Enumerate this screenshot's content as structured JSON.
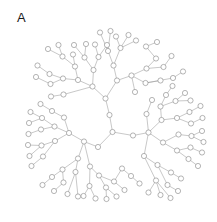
{
  "panel": {
    "label": "A",
    "width": 217,
    "height": 222,
    "background": "#ffffff"
  },
  "chart_data": {
    "type": "diagram",
    "subtype": "radial-tree-graph",
    "title": "A",
    "xlabel": "",
    "ylabel": "",
    "grid": false,
    "legend": null,
    "style": {
      "node_fill": "#ffffff",
      "node_stroke": "#8c8c8c",
      "node_radius": 2.6,
      "edge_color": "#9a9a9a",
      "edge_width": 0.55
    },
    "root": "n0",
    "node_count": 121,
    "edge_count": 120,
    "nodes": [
      {
        "id": "n0",
        "x": 112.5,
        "y": 132.0,
        "depth": 0
      },
      {
        "id": "n1",
        "x": 109.5,
        "y": 115.0,
        "depth": 1
      },
      {
        "id": "n2",
        "x": 133.0,
        "y": 135.5,
        "depth": 1
      },
      {
        "id": "n3",
        "x": 98.0,
        "y": 147.0,
        "depth": 1
      },
      {
        "id": "n4",
        "x": 105.5,
        "y": 98.5,
        "depth": 2
      },
      {
        "id": "n5",
        "x": 92.5,
        "y": 86.5,
        "depth": 3
      },
      {
        "id": "n6",
        "x": 117.0,
        "y": 80.5,
        "depth": 3
      },
      {
        "id": "n7",
        "x": 78.0,
        "y": 80.0,
        "depth": 4
      },
      {
        "id": "n8",
        "x": 93.5,
        "y": 70.0,
        "depth": 4
      },
      {
        "id": "n9",
        "x": 63.0,
        "y": 78.5,
        "depth": 5
      },
      {
        "id": "n10",
        "x": 75.0,
        "y": 66.5,
        "depth": 5
      },
      {
        "id": "n11",
        "x": 49.5,
        "y": 74.0,
        "depth": 6
      },
      {
        "id": "n12",
        "x": 50.5,
        "y": 84.0,
        "depth": 6
      },
      {
        "id": "n13",
        "x": 37.5,
        "y": 65.5,
        "depth": 6
      },
      {
        "id": "n14",
        "x": 36.0,
        "y": 77.0,
        "depth": 6
      },
      {
        "id": "n15",
        "x": 62.5,
        "y": 56.5,
        "depth": 6
      },
      {
        "id": "n16",
        "x": 73.0,
        "y": 54.5,
        "depth": 6
      },
      {
        "id": "n17",
        "x": 48.0,
        "y": 49.0,
        "depth": 7
      },
      {
        "id": "n18",
        "x": 58.5,
        "y": 45.0,
        "depth": 7
      },
      {
        "id": "n19",
        "x": 84.5,
        "y": 57.5,
        "depth": 5
      },
      {
        "id": "n20",
        "x": 98.5,
        "y": 57.0,
        "depth": 5
      },
      {
        "id": "n21",
        "x": 74.0,
        "y": 45.0,
        "depth": 6
      },
      {
        "id": "n22",
        "x": 86.0,
        "y": 44.0,
        "depth": 6
      },
      {
        "id": "n23",
        "x": 95.0,
        "y": 44.5,
        "depth": 6
      },
      {
        "id": "n24",
        "x": 107.0,
        "y": 45.0,
        "depth": 6
      },
      {
        "id": "n25",
        "x": 113.5,
        "y": 65.5,
        "depth": 4
      },
      {
        "id": "n26",
        "x": 131.5,
        "y": 75.5,
        "depth": 4
      },
      {
        "id": "n27",
        "x": 108.0,
        "y": 51.0,
        "depth": 5
      },
      {
        "id": "n28",
        "x": 120.5,
        "y": 48.0,
        "depth": 5
      },
      {
        "id": "n29",
        "x": 116.0,
        "y": 36.5,
        "depth": 6
      },
      {
        "id": "n30",
        "x": 128.5,
        "y": 35.0,
        "depth": 6
      },
      {
        "id": "n31",
        "x": 136.0,
        "y": 40.5,
        "depth": 6
      },
      {
        "id": "n32",
        "x": 146.5,
        "y": 68.5,
        "depth": 5
      },
      {
        "id": "n33",
        "x": 145.5,
        "y": 83.0,
        "depth": 5
      },
      {
        "id": "n34",
        "x": 156.0,
        "y": 58.5,
        "depth": 6
      },
      {
        "id": "n35",
        "x": 163.5,
        "y": 67.0,
        "depth": 6
      },
      {
        "id": "n36",
        "x": 171.5,
        "y": 56.0,
        "depth": 7
      },
      {
        "id": "n37",
        "x": 160.5,
        "y": 80.5,
        "depth": 6
      },
      {
        "id": "n38",
        "x": 173.0,
        "y": 78.0,
        "depth": 6
      },
      {
        "id": "n39",
        "x": 183.0,
        "y": 71.5,
        "depth": 7
      },
      {
        "id": "n40",
        "x": 148.5,
        "y": 132.5,
        "depth": 2
      },
      {
        "id": "n41",
        "x": 161.5,
        "y": 120.0,
        "depth": 3
      },
      {
        "id": "n42",
        "x": 163.0,
        "y": 142.5,
        "depth": 3
      },
      {
        "id": "n43",
        "x": 160.5,
        "y": 106.5,
        "depth": 4
      },
      {
        "id": "n44",
        "x": 177.0,
        "y": 118.0,
        "depth": 4
      },
      {
        "id": "n45",
        "x": 166.0,
        "y": 95.0,
        "depth": 5
      },
      {
        "id": "n46",
        "x": 175.5,
        "y": 101.0,
        "depth": 5
      },
      {
        "id": "n47",
        "x": 172.5,
        "y": 86.0,
        "depth": 6
      },
      {
        "id": "n48",
        "x": 185.0,
        "y": 93.0,
        "depth": 6
      },
      {
        "id": "n49",
        "x": 190.5,
        "y": 100.5,
        "depth": 6
      },
      {
        "id": "n50",
        "x": 189.5,
        "y": 112.0,
        "depth": 5
      },
      {
        "id": "n51",
        "x": 191.0,
        "y": 123.5,
        "depth": 5
      },
      {
        "id": "n52",
        "x": 200.5,
        "y": 106.0,
        "depth": 6
      },
      {
        "id": "n53",
        "x": 202.5,
        "y": 118.0,
        "depth": 6
      },
      {
        "id": "n54",
        "x": 178.5,
        "y": 134.5,
        "depth": 4
      },
      {
        "id": "n55",
        "x": 177.0,
        "y": 150.5,
        "depth": 4
      },
      {
        "id": "n56",
        "x": 191.5,
        "y": 136.0,
        "depth": 5
      },
      {
        "id": "n57",
        "x": 202.0,
        "y": 131.0,
        "depth": 6
      },
      {
        "id": "n58",
        "x": 203.5,
        "y": 142.0,
        "depth": 6
      },
      {
        "id": "n59",
        "x": 190.5,
        "y": 147.5,
        "depth": 5
      },
      {
        "id": "n60",
        "x": 202.0,
        "y": 152.5,
        "depth": 6
      },
      {
        "id": "n61",
        "x": 188.5,
        "y": 159.0,
        "depth": 5
      },
      {
        "id": "n62",
        "x": 198.0,
        "y": 166.0,
        "depth": 6
      },
      {
        "id": "n63",
        "x": 144.0,
        "y": 156.0,
        "depth": 3
      },
      {
        "id": "n64",
        "x": 157.5,
        "y": 165.0,
        "depth": 4
      },
      {
        "id": "n65",
        "x": 171.0,
        "y": 172.5,
        "depth": 5
      },
      {
        "id": "n66",
        "x": 181.0,
        "y": 178.5,
        "depth": 6
      },
      {
        "id": "n67",
        "x": 167.5,
        "y": 185.0,
        "depth": 5
      },
      {
        "id": "n68",
        "x": 178.0,
        "y": 191.0,
        "depth": 6
      },
      {
        "id": "n69",
        "x": 156.0,
        "y": 180.5,
        "depth": 4
      },
      {
        "id": "n70",
        "x": 148.5,
        "y": 192.5,
        "depth": 5
      },
      {
        "id": "n71",
        "x": 160.5,
        "y": 195.0,
        "depth": 5
      },
      {
        "id": "n72",
        "x": 170.5,
        "y": 198.0,
        "depth": 5
      },
      {
        "id": "n73",
        "x": 84.0,
        "y": 141.5,
        "depth": 2
      },
      {
        "id": "n74",
        "x": 69.0,
        "y": 133.0,
        "depth": 3
      },
      {
        "id": "n75",
        "x": 78.0,
        "y": 158.5,
        "depth": 3
      },
      {
        "id": "n76",
        "x": 54.5,
        "y": 126.5,
        "depth": 4
      },
      {
        "id": "n77",
        "x": 55.0,
        "y": 141.0,
        "depth": 4
      },
      {
        "id": "n78",
        "x": 42.0,
        "y": 118.0,
        "depth": 5
      },
      {
        "id": "n79",
        "x": 41.0,
        "y": 129.5,
        "depth": 5
      },
      {
        "id": "n80",
        "x": 30.5,
        "y": 112.0,
        "depth": 6
      },
      {
        "id": "n81",
        "x": 29.0,
        "y": 123.0,
        "depth": 6
      },
      {
        "id": "n82",
        "x": 28.5,
        "y": 134.0,
        "depth": 6
      },
      {
        "id": "n83",
        "x": 41.5,
        "y": 145.5,
        "depth": 5
      },
      {
        "id": "n84",
        "x": 28.0,
        "y": 145.0,
        "depth": 6
      },
      {
        "id": "n85",
        "x": 29.5,
        "y": 156.0,
        "depth": 6
      },
      {
        "id": "n86",
        "x": 43.0,
        "y": 156.5,
        "depth": 5
      },
      {
        "id": "n87",
        "x": 31.5,
        "y": 166.0,
        "depth": 6
      },
      {
        "id": "n88",
        "x": 62.5,
        "y": 169.5,
        "depth": 4
      },
      {
        "id": "n89",
        "x": 75.5,
        "y": 172.0,
        "depth": 4
      },
      {
        "id": "n90",
        "x": 52.0,
        "y": 177.0,
        "depth": 5
      },
      {
        "id": "n91",
        "x": 63.5,
        "y": 182.5,
        "depth": 5
      },
      {
        "id": "n92",
        "x": 42.5,
        "y": 185.0,
        "depth": 6
      },
      {
        "id": "n93",
        "x": 54.0,
        "y": 191.0,
        "depth": 6
      },
      {
        "id": "n94",
        "x": 67.5,
        "y": 194.0,
        "depth": 6
      },
      {
        "id": "n95",
        "x": 78.0,
        "y": 196.5,
        "depth": 6
      },
      {
        "id": "n96",
        "x": 90.0,
        "y": 166.5,
        "depth": 4
      },
      {
        "id": "n97",
        "x": 99.0,
        "y": 175.5,
        "depth": 5
      },
      {
        "id": "n98",
        "x": 89.5,
        "y": 186.0,
        "depth": 5
      },
      {
        "id": "n99",
        "x": 83.5,
        "y": 196.0,
        "depth": 6
      },
      {
        "id": "n100",
        "x": 95.5,
        "y": 198.5,
        "depth": 6
      },
      {
        "id": "n101",
        "x": 106.0,
        "y": 187.5,
        "depth": 5
      },
      {
        "id": "n102",
        "x": 106.5,
        "y": 199.0,
        "depth": 6
      },
      {
        "id": "n103",
        "x": 116.5,
        "y": 196.5,
        "depth": 6
      },
      {
        "id": "n104",
        "x": 114.0,
        "y": 181.5,
        "depth": 5
      },
      {
        "id": "n105",
        "x": 124.5,
        "y": 190.0,
        "depth": 6
      },
      {
        "id": "n106",
        "x": 64.0,
        "y": 117.5,
        "depth": 4
      },
      {
        "id": "n107",
        "x": 52.0,
        "y": 111.0,
        "depth": 5
      },
      {
        "id": "n108",
        "x": 40.5,
        "y": 104.0,
        "depth": 6
      },
      {
        "id": "n109",
        "x": 122.0,
        "y": 168.5,
        "depth": 4
      },
      {
        "id": "n110",
        "x": 131.0,
        "y": 176.0,
        "depth": 5
      },
      {
        "id": "n111",
        "x": 139.5,
        "y": 183.5,
        "depth": 6
      },
      {
        "id": "n112",
        "x": 146.5,
        "y": 114.0,
        "depth": 4
      },
      {
        "id": "n113",
        "x": 152.0,
        "y": 100.0,
        "depth": 5
      },
      {
        "id": "n114",
        "x": 100.0,
        "y": 32.5,
        "depth": 7
      },
      {
        "id": "n115",
        "x": 110.5,
        "y": 31.0,
        "depth": 7
      },
      {
        "id": "n116",
        "x": 63.5,
        "y": 94.5,
        "depth": 5
      },
      {
        "id": "n117",
        "x": 51.0,
        "y": 96.5,
        "depth": 6
      },
      {
        "id": "n118",
        "x": 135.0,
        "y": 92.0,
        "depth": 5
      },
      {
        "id": "n119",
        "x": 146.0,
        "y": 46.5,
        "depth": 6
      },
      {
        "id": "n120",
        "x": 157.0,
        "y": 42.0,
        "depth": 7
      }
    ],
    "edges": [
      [
        "n0",
        "n1"
      ],
      [
        "n0",
        "n2"
      ],
      [
        "n0",
        "n3"
      ],
      [
        "n1",
        "n4"
      ],
      [
        "n4",
        "n5"
      ],
      [
        "n4",
        "n6"
      ],
      [
        "n5",
        "n7"
      ],
      [
        "n5",
        "n8"
      ],
      [
        "n5",
        "n116"
      ],
      [
        "n7",
        "n9"
      ],
      [
        "n7",
        "n10"
      ],
      [
        "n9",
        "n11"
      ],
      [
        "n9",
        "n12"
      ],
      [
        "n11",
        "n13"
      ],
      [
        "n12",
        "n14"
      ],
      [
        "n10",
        "n15"
      ],
      [
        "n10",
        "n16"
      ],
      [
        "n15",
        "n17"
      ],
      [
        "n15",
        "n18"
      ],
      [
        "n8",
        "n19"
      ],
      [
        "n8",
        "n20"
      ],
      [
        "n19",
        "n21"
      ],
      [
        "n19",
        "n22"
      ],
      [
        "n20",
        "n23"
      ],
      [
        "n20",
        "n24"
      ],
      [
        "n116",
        "n117"
      ],
      [
        "n6",
        "n25"
      ],
      [
        "n6",
        "n26"
      ],
      [
        "n25",
        "n27"
      ],
      [
        "n25",
        "n28"
      ],
      [
        "n28",
        "n29"
      ],
      [
        "n28",
        "n30"
      ],
      [
        "n28",
        "n31"
      ],
      [
        "n27",
        "n114"
      ],
      [
        "n27",
        "n115"
      ],
      [
        "n26",
        "n32"
      ],
      [
        "n26",
        "n33"
      ],
      [
        "n26",
        "n118"
      ],
      [
        "n32",
        "n34"
      ],
      [
        "n32",
        "n35"
      ],
      [
        "n35",
        "n36"
      ],
      [
        "n34",
        "n119"
      ],
      [
        "n119",
        "n120"
      ],
      [
        "n33",
        "n37"
      ],
      [
        "n33",
        "n38"
      ],
      [
        "n38",
        "n39"
      ],
      [
        "n2",
        "n40"
      ],
      [
        "n40",
        "n41"
      ],
      [
        "n40",
        "n42"
      ],
      [
        "n40",
        "n63"
      ],
      [
        "n40",
        "n112"
      ],
      [
        "n41",
        "n43"
      ],
      [
        "n41",
        "n44"
      ],
      [
        "n43",
        "n45"
      ],
      [
        "n43",
        "n46"
      ],
      [
        "n45",
        "n47"
      ],
      [
        "n46",
        "n48"
      ],
      [
        "n46",
        "n49"
      ],
      [
        "n44",
        "n50"
      ],
      [
        "n44",
        "n51"
      ],
      [
        "n50",
        "n52"
      ],
      [
        "n51",
        "n53"
      ],
      [
        "n42",
        "n54"
      ],
      [
        "n42",
        "n55"
      ],
      [
        "n54",
        "n56"
      ],
      [
        "n56",
        "n57"
      ],
      [
        "n56",
        "n58"
      ],
      [
        "n55",
        "n59"
      ],
      [
        "n55",
        "n61"
      ],
      [
        "n59",
        "n60"
      ],
      [
        "n61",
        "n62"
      ],
      [
        "n63",
        "n64"
      ],
      [
        "n63",
        "n69"
      ],
      [
        "n64",
        "n65"
      ],
      [
        "n64",
        "n67"
      ],
      [
        "n65",
        "n66"
      ],
      [
        "n67",
        "n68"
      ],
      [
        "n69",
        "n70"
      ],
      [
        "n69",
        "n71"
      ],
      [
        "n69",
        "n72"
      ],
      [
        "n112",
        "n113"
      ],
      [
        "n3",
        "n73"
      ],
      [
        "n73",
        "n74"
      ],
      [
        "n73",
        "n75"
      ],
      [
        "n73",
        "n96"
      ],
      [
        "n74",
        "n76"
      ],
      [
        "n74",
        "n77"
      ],
      [
        "n74",
        "n106"
      ],
      [
        "n76",
        "n78"
      ],
      [
        "n76",
        "n79"
      ],
      [
        "n78",
        "n80"
      ],
      [
        "n78",
        "n81"
      ],
      [
        "n79",
        "n82"
      ],
      [
        "n77",
        "n83"
      ],
      [
        "n77",
        "n86"
      ],
      [
        "n83",
        "n84"
      ],
      [
        "n83",
        "n85"
      ],
      [
        "n86",
        "n87"
      ],
      [
        "n106",
        "n107"
      ],
      [
        "n107",
        "n108"
      ],
      [
        "n75",
        "n88"
      ],
      [
        "n75",
        "n89"
      ],
      [
        "n88",
        "n90"
      ],
      [
        "n88",
        "n91"
      ],
      [
        "n90",
        "n92"
      ],
      [
        "n91",
        "n93"
      ],
      [
        "n89",
        "n94"
      ],
      [
        "n89",
        "n95"
      ],
      [
        "n96",
        "n97"
      ],
      [
        "n96",
        "n98"
      ],
      [
        "n98",
        "n99"
      ],
      [
        "n98",
        "n100"
      ],
      [
        "n97",
        "n101"
      ],
      [
        "n97",
        "n104"
      ],
      [
        "n101",
        "n102"
      ],
      [
        "n101",
        "n103"
      ],
      [
        "n104",
        "n105"
      ],
      [
        "n104",
        "n109"
      ],
      [
        "n109",
        "n110"
      ],
      [
        "n110",
        "n111"
      ]
    ]
  }
}
